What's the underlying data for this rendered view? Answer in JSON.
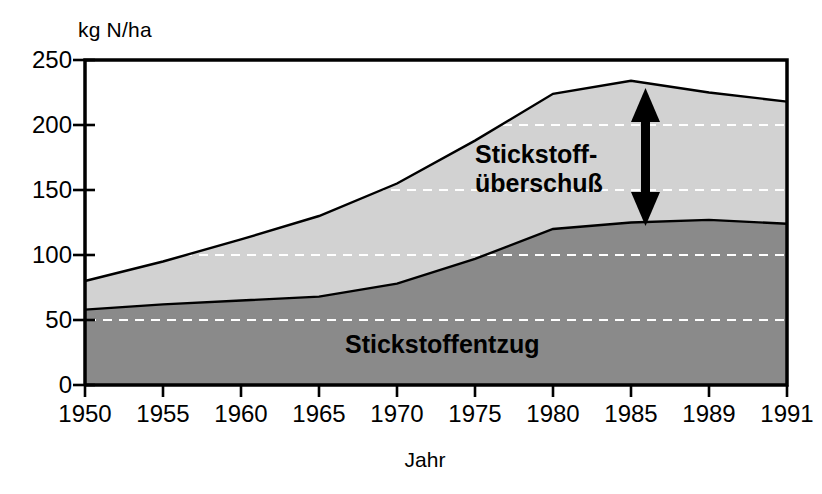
{
  "chart_data": {
    "type": "area",
    "stacked": true,
    "title": "",
    "xlabel": "Jahr",
    "ylabel": "kg N/ha",
    "categories": [
      "1950",
      "1955",
      "1960",
      "1965",
      "1970",
      "1975",
      "1980",
      "1985",
      "1989",
      "1991"
    ],
    "ylim": [
      0,
      250
    ],
    "yticks": [
      0,
      50,
      100,
      150,
      200,
      250
    ],
    "grid": "horizontal-dashed",
    "legend": "in-plot-annotations",
    "series": [
      {
        "name": "Stickstoffentzug",
        "values": [
          58,
          62,
          65,
          68,
          78,
          97,
          120,
          125,
          127,
          124
        ],
        "color": "#8a8a8a"
      },
      {
        "name": "Stickstoffüberschuß",
        "values": [
          22,
          33,
          47,
          62,
          77,
          91,
          104,
          109,
          98,
          94
        ],
        "color": "#d2d2d2"
      }
    ],
    "totals": [
      80,
      95,
      112,
      130,
      155,
      188,
      224,
      234,
      225,
      218
    ],
    "annotations": [
      {
        "name": "surplus-arrow",
        "label": "",
        "kind": "double-headed-vertical-arrow",
        "x_category": "1985"
      }
    ]
  },
  "axes": {
    "y_unit_label": "kg N/ha",
    "x_title": "Jahr",
    "y_tick_labels": [
      "250",
      "200",
      "150",
      "100",
      "50",
      "0"
    ],
    "x_tick_labels": [
      "1950",
      "1955",
      "1960",
      "1965",
      "1970",
      "1975",
      "1980",
      "1985",
      "1989",
      "1991"
    ]
  },
  "labels": {
    "surplus_line1": "Stickstoff-",
    "surplus_line2": "überschuß",
    "uptake": "Stickstoffentzug"
  },
  "colors": {
    "surplus_fill": "#d2d2d2",
    "uptake_fill": "#8a8a8a",
    "outline": "#000000",
    "grid": "#ffffff",
    "background": "#ffffff"
  }
}
